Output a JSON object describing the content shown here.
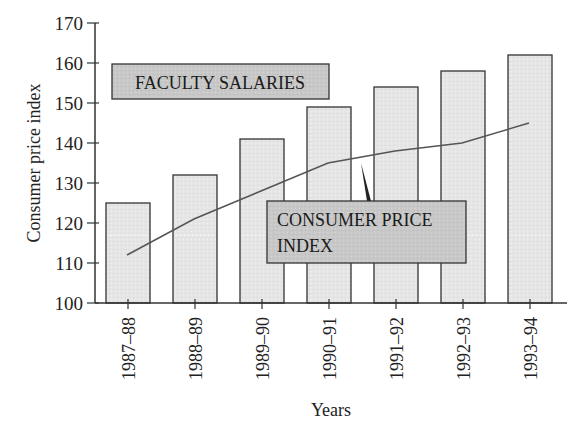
{
  "chart_data": {
    "type": "bar",
    "title": "",
    "xlabel": "Years",
    "ylabel": "Consumer price index",
    "ylim": [
      100,
      170
    ],
    "yticks": [
      100,
      110,
      120,
      130,
      140,
      150,
      160,
      170
    ],
    "grid": false,
    "categories": [
      "1987–88",
      "1988–89",
      "1989–90",
      "1990–91",
      "1991–92",
      "1992–93",
      "1993–94"
    ],
    "series": [
      {
        "name": "FACULTY SALARIES",
        "type": "bar",
        "values": [
          125,
          132,
          141,
          149,
          154,
          158,
          162
        ]
      },
      {
        "name": "CONSUMER PRICE INDEX",
        "type": "line",
        "values": [
          112,
          121,
          128,
          135,
          138,
          140,
          145
        ]
      }
    ],
    "annotations": [
      {
        "text": "FACULTY SALARIES",
        "kind": "label-box"
      },
      {
        "text": "CONSUMER PRICE INDEX",
        "kind": "callout-box",
        "points_to": "line"
      }
    ],
    "colors": {
      "bar_fill": "#e6e6e6",
      "bar_stroke": "#333333",
      "line": "#555555",
      "label_box_fill": "#c8c8c8"
    }
  }
}
